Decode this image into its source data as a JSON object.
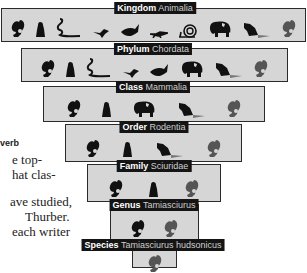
{
  "diagram": {
    "tiers": [
      {
        "rank": "Kingdom",
        "name": "Animalia",
        "icons": [
          "squirrel",
          "groundhog",
          "snake",
          "bird",
          "fish",
          "lizard",
          "snail",
          "elephant",
          "beaver",
          "squirrel-gray"
        ]
      },
      {
        "rank": "Phylum",
        "name": "Chordata",
        "icons": [
          "squirrel",
          "groundhog",
          "snake",
          "bird",
          "fish",
          "elephant",
          "beaver",
          "squirrel-gray"
        ]
      },
      {
        "rank": "Class",
        "name": "Mammalia",
        "icons": [
          "squirrel",
          "groundhog",
          "elephant",
          "beaver",
          "squirrel-gray"
        ]
      },
      {
        "rank": "Order",
        "name": "Rodentia",
        "icons": [
          "squirrel",
          "groundhog",
          "beaver",
          "squirrel-gray"
        ]
      },
      {
        "rank": "Family",
        "name": "Sciuridae",
        "icons": [
          "squirrel",
          "groundhog",
          "squirrel-gray"
        ]
      },
      {
        "rank": "Genus",
        "name": "Tamiasciurus",
        "icons": [
          "squirrel",
          "squirrel-gray"
        ]
      },
      {
        "rank": "Species",
        "name": "Tamiasciurus hudsonicus",
        "icons": [
          "squirrel-gray"
        ]
      }
    ]
  },
  "side_text": {
    "heading": "verb",
    "lines": [
      "e top-",
      "hat clas-",
      "",
      "ave studied,",
      "Thurber.",
      "each writer",
      "ur have ..."
    ]
  },
  "colors": {
    "tier_fill": "#d6d6d6",
    "tier_border": "#2a2a2a",
    "label_bg": "#141414",
    "label_text": "#ffffff",
    "silhouette_dark": "#111111",
    "silhouette_gray": "#555555"
  }
}
